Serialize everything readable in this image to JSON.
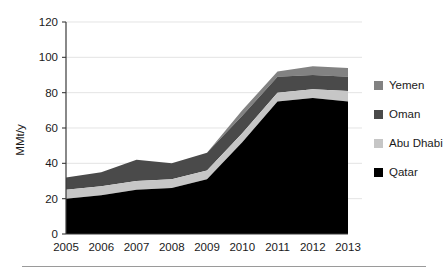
{
  "chart_data": {
    "type": "area",
    "title": "",
    "subtitle": "",
    "xlabel": "",
    "ylabel": "MMt/y",
    "x": [
      2005,
      2006,
      2007,
      2008,
      2009,
      2010,
      2011,
      2012,
      2013
    ],
    "xtick_labels": [
      "2005",
      "2006",
      "2007",
      "2008",
      "2009",
      "2010",
      "2011",
      "2012",
      "2013"
    ],
    "ytick_labels": [
      "0",
      "20",
      "40",
      "60",
      "80",
      "100",
      "120"
    ],
    "yticks": [
      0,
      20,
      40,
      60,
      80,
      100,
      120
    ],
    "ylim": [
      0,
      120
    ],
    "xlim": [
      2005,
      2013
    ],
    "grid": true,
    "stacked": true,
    "legend_position": "right",
    "series": [
      {
        "name": "Qatar",
        "color": "#000000",
        "values": [
          20,
          22,
          25,
          26,
          31,
          52,
          75,
          77,
          75
        ]
      },
      {
        "name": "Abu Dhabi",
        "color": "#c6c6c6",
        "values": [
          5,
          5,
          5,
          5,
          5,
          5,
          5,
          5,
          6
        ]
      },
      {
        "name": "Oman",
        "color": "#4a4a4a",
        "values": [
          7,
          8,
          12,
          9,
          10,
          10,
          9,
          8,
          8
        ]
      },
      {
        "name": "Yemen",
        "color": "#828282",
        "values": [
          0,
          0,
          0,
          0,
          0,
          3,
          3,
          5,
          5
        ]
      }
    ],
    "legend_order": [
      "Yemen",
      "Oman",
      "Abu Dhabi",
      "Qatar"
    ]
  },
  "legend": {
    "items": [
      {
        "label": "Yemen",
        "color": "#828282"
      },
      {
        "label": "Oman",
        "color": "#4a4a4a"
      },
      {
        "label": "Abu Dhabi",
        "color": "#c6c6c6"
      },
      {
        "label": "Qatar",
        "color": "#000000"
      }
    ]
  },
  "axes": {
    "y_title": "MMt/y"
  }
}
